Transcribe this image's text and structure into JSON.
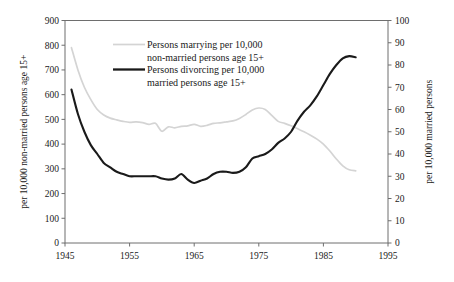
{
  "chart_data": {
    "type": "line",
    "title": "",
    "xlabel": "",
    "xlim": [
      1945,
      1995
    ],
    "xticks": [
      1945,
      1955,
      1965,
      1975,
      1985,
      1995
    ],
    "grid": false,
    "legend_position": "top-center-left",
    "axes": {
      "left": {
        "label": "per 10,000 non-married persons age 15+",
        "min": 0,
        "max": 900,
        "step": 100,
        "ticks": [
          0,
          100,
          200,
          300,
          400,
          500,
          600,
          700,
          800,
          900
        ]
      },
      "right": {
        "label": "per 10,000 married persons",
        "min": 0,
        "max": 100,
        "step": 10,
        "ticks": [
          0,
          10,
          20,
          30,
          40,
          50,
          60,
          70,
          80,
          90,
          100
        ]
      }
    },
    "series": [
      {
        "name": "Persons marrying per 10,000 non-married persons age 15+",
        "axis": "left",
        "color": "#d4d4d4",
        "width": 1.7,
        "x": [
          1946,
          1947,
          1948,
          1949,
          1950,
          1951,
          1952,
          1953,
          1954,
          1955,
          1956,
          1957,
          1958,
          1959,
          1960,
          1961,
          1962,
          1963,
          1964,
          1965,
          1966,
          1967,
          1968,
          1969,
          1970,
          1971,
          1972,
          1973,
          1974,
          1975,
          1976,
          1977,
          1978,
          1979,
          1980,
          1981,
          1982,
          1983,
          1984,
          1985,
          1986,
          1987,
          1988,
          1989,
          1990
        ],
        "y": [
          790,
          700,
          630,
          580,
          540,
          518,
          505,
          498,
          492,
          488,
          490,
          487,
          480,
          484,
          452,
          470,
          466,
          472,
          474,
          480,
          472,
          476,
          484,
          486,
          490,
          494,
          504,
          520,
          538,
          546,
          540,
          516,
          492,
          484,
          474,
          462,
          450,
          436,
          420,
          400,
          372,
          340,
          312,
          296,
          292
        ]
      },
      {
        "name": "Persons divorcing per 10,000 married persons age 15+",
        "axis": "right",
        "color": "#1a1a1a",
        "width": 2.1,
        "x": [
          1946,
          1947,
          1948,
          1949,
          1950,
          1951,
          1952,
          1953,
          1954,
          1955,
          1956,
          1957,
          1958,
          1959,
          1960,
          1961,
          1962,
          1963,
          1964,
          1965,
          1966,
          1967,
          1968,
          1969,
          1970,
          1971,
          1972,
          1973,
          1974,
          1975,
          1976,
          1977,
          1978,
          1979,
          1980,
          1981,
          1982,
          1983,
          1984,
          1985,
          1986,
          1987,
          1988,
          1989,
          1990
        ],
        "y": [
          69,
          60,
          52,
          45,
          40,
          36,
          34,
          32,
          31,
          30,
          30,
          30,
          30,
          29.5,
          29,
          29,
          29,
          28.5,
          29,
          28,
          27.5,
          29,
          30,
          31,
          32,
          32,
          31,
          32,
          34,
          37,
          39,
          39.5,
          40,
          42,
          44,
          46,
          48,
          50,
          52,
          55,
          57,
          60,
          63,
          66,
          69
        ],
        "y_note": "right-axis values per 10,000 married persons"
      }
    ],
    "divorce_full": {
      "x": [
        1946,
        1947,
        1948,
        1949,
        1950,
        1951,
        1952,
        1953,
        1954,
        1955,
        1956,
        1957,
        1958,
        1959,
        1960,
        1961,
        1962,
        1963,
        1964,
        1965,
        1966,
        1967,
        1968,
        1969,
        1970,
        1971,
        1972,
        1973,
        1974,
        1975,
        1976,
        1977,
        1978,
        1979,
        1980,
        1981,
        1982,
        1983,
        1984,
        1985,
        1986,
        1987,
        1988,
        1989,
        1990
      ],
      "y": [
        69,
        58,
        50,
        44,
        40,
        36,
        34,
        32,
        31,
        30,
        30,
        30,
        30,
        30,
        29,
        28.5,
        29,
        31,
        28.5,
        27,
        28,
        29,
        31,
        32,
        32,
        31.5,
        32,
        34,
        38,
        39,
        40,
        42,
        45,
        47,
        50,
        55,
        59,
        62,
        66,
        71,
        76,
        80,
        83,
        84,
        83.5
      ]
    }
  },
  "legend": {
    "items": [
      {
        "line1": "Persons marrying per 10,000",
        "line2": "non-married persons age 15+",
        "swatch": "#d4d4d4"
      },
      {
        "line1": "Persons divorcing per 10,000",
        "line2": "married persons age 15+",
        "swatch": "#1a1a1a"
      }
    ]
  },
  "labels": {
    "left_axis_title": "per 10,000 non-married persons age 15+",
    "right_axis_title": "per 10,000 married persons",
    "left_ticks": [
      "900",
      "800",
      "700",
      "600",
      "500",
      "400",
      "300",
      "200",
      "100",
      "0"
    ],
    "right_ticks": [
      "100",
      "90",
      "80",
      "70",
      "60",
      "50",
      "40",
      "30",
      "20",
      "10",
      "0"
    ],
    "x_ticks": [
      "1945",
      "1955",
      "1965",
      "1975",
      "1985",
      "1995"
    ]
  },
  "colors": {
    "marrying": "#d4d4d4",
    "divorcing": "#1a1a1a",
    "frame": "#6e6e6e",
    "background": "#ffffff"
  }
}
